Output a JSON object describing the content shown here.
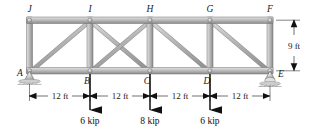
{
  "figure": {
    "type": "truss-free-body-diagram",
    "span_ft": 48,
    "height_ft": 9,
    "panel_count": 4
  },
  "joints": {
    "bottom": [
      {
        "id": "A",
        "label": "A",
        "x_ft": 0,
        "support": "pin"
      },
      {
        "id": "B",
        "label": "B",
        "x_ft": 12,
        "support": "none"
      },
      {
        "id": "C",
        "label": "C",
        "x_ft": 24,
        "support": "none"
      },
      {
        "id": "D",
        "label": "D",
        "x_ft": 36,
        "support": "none"
      },
      {
        "id": "E",
        "label": "E",
        "x_ft": 48,
        "support": "roller"
      }
    ],
    "top": [
      {
        "id": "J",
        "label": "J",
        "x_ft": 0
      },
      {
        "id": "I",
        "label": "I",
        "x_ft": 12
      },
      {
        "id": "H",
        "label": "H",
        "x_ft": 24
      },
      {
        "id": "G",
        "label": "G",
        "x_ft": 36
      },
      {
        "id": "F",
        "label": "F",
        "x_ft": 48
      }
    ]
  },
  "members": {
    "top_chord": [
      "J-I",
      "I-H",
      "H-G",
      "G-F"
    ],
    "bottom_chord": [
      "A-B",
      "B-C",
      "C-D",
      "D-E"
    ],
    "verticals": [
      "A-J",
      "B-I",
      "C-H",
      "D-G",
      "E-F"
    ],
    "diagonals": [
      "A-I",
      "B-H",
      "H-D",
      "G-E"
    ]
  },
  "loads": [
    {
      "at": "B",
      "magnitude": "6 kip",
      "value": 6,
      "unit": "kip",
      "direction": "down"
    },
    {
      "at": "C",
      "magnitude": "8 kip",
      "value": 8,
      "unit": "kip",
      "direction": "down"
    },
    {
      "at": "D",
      "magnitude": "6 kip",
      "value": 6,
      "unit": "kip",
      "direction": "down"
    }
  ],
  "dimensions": {
    "horizontal": [
      {
        "label": "12 ft",
        "from": "A",
        "to": "B"
      },
      {
        "label": "12 ft",
        "from": "B",
        "to": "C"
      },
      {
        "label": "12 ft",
        "from": "C",
        "to": "D"
      },
      {
        "label": "12 ft",
        "from": "D",
        "to": "E"
      }
    ],
    "vertical": [
      {
        "label": "9 ft",
        "from": "F",
        "to": "E"
      }
    ]
  },
  "colors": {
    "member_fill": "#b9b9b9",
    "member_light": "#d8d8d8",
    "member_dark": "#8f8f8f",
    "outline": "#5a5a5a",
    "text": "#1a1a1a",
    "arrow": "#111111",
    "background": "#ffffff"
  }
}
